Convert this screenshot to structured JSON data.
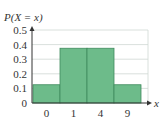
{
  "chart_data": {
    "type": "bar",
    "title": "",
    "xlabel": "x",
    "ylabel": "P(X = x)",
    "categories": [
      "0",
      "1",
      "4",
      "9"
    ],
    "values": [
      0.125,
      0.375,
      0.375,
      0.125
    ],
    "ylim": [
      0,
      0.5
    ],
    "yticks": [
      "0",
      "0.1",
      "0.2",
      "0.3",
      "0.4",
      "0.5"
    ],
    "ytick_values": [
      0,
      0.1,
      0.2,
      0.3,
      0.4,
      0.5
    ],
    "grid": true,
    "legend": "none",
    "colors": {
      "bar_fill": "#6dbb8a",
      "bar_stroke": "#3f8a5c",
      "grid": "#cfd8d3",
      "axis": "#333333"
    }
  }
}
